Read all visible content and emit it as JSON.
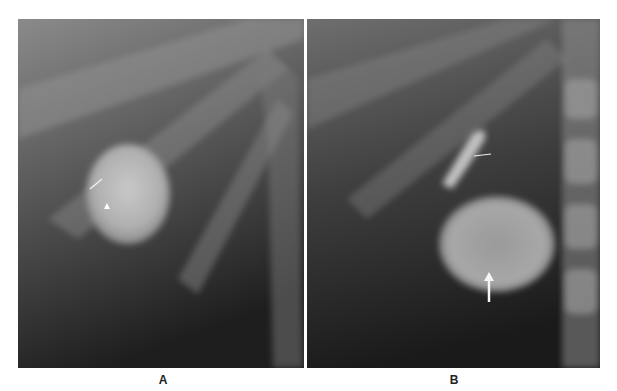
{
  "figure": {
    "panels": [
      {
        "id": "A",
        "label": "A",
        "description": "Radiograph with rounded radiopaque mass; small arrow and arrowhead markers"
      },
      {
        "id": "B",
        "label": "B",
        "description": "Radiograph showing rounded mass adjacent to spine; short arrow and long vertical arrow markers"
      }
    ],
    "colors": {
      "background": "#ffffff",
      "label": "#222222"
    }
  }
}
